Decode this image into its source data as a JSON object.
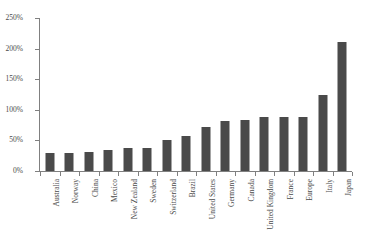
{
  "chart_data": {
    "type": "bar",
    "title": "",
    "title_partial_cropped": "",
    "xlabel": "",
    "ylabel": "",
    "ylim": [
      0,
      250
    ],
    "ytick_labels": [
      "0%",
      "50%",
      "100%",
      "150%",
      "200%",
      "250%"
    ],
    "ytick_values": [
      0,
      50,
      100,
      150,
      200,
      250
    ],
    "grid": false,
    "legend": false,
    "bar_color": "#4a4a4a",
    "axis_color": "#808080",
    "categories": [
      "Australia",
      "Norway",
      "China",
      "Mexico",
      "New Zealand",
      "Sweden",
      "Switzerland",
      "Brazil",
      "United States",
      "Germany",
      "Canada",
      "United Kingdom",
      "France",
      "Europe",
      "Italy",
      "Japan"
    ],
    "values": [
      29,
      29,
      31,
      35,
      38,
      38,
      51,
      58,
      72,
      82,
      83,
      88,
      88,
      89,
      124,
      211
    ]
  }
}
